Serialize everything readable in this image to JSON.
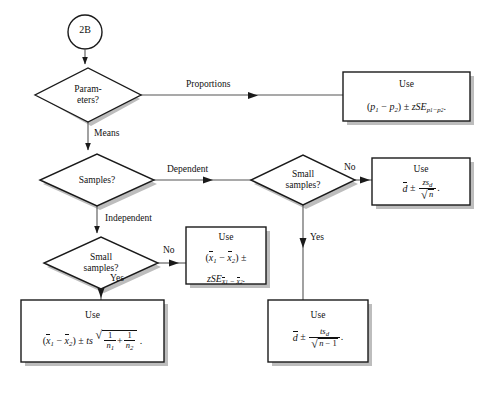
{
  "diagram": {
    "colors": {
      "stroke": "#1a1a1a",
      "shadow": "#b9b9b9",
      "connector": "#555555",
      "background": "#ffffff"
    },
    "nodes": {
      "start": {
        "label": "2B",
        "shape": "circle"
      },
      "parameters": {
        "label_line1": "Param-",
        "label_line2": "eters?",
        "shape": "diamond"
      },
      "samples": {
        "label_line1": "Samples?",
        "shape": "diamond"
      },
      "small_samples_dependent": {
        "label_line1": "Small",
        "label_line2": "samples?",
        "shape": "diamond"
      },
      "small_samples_independent": {
        "label_line1": "Small",
        "label_line2": "samples?",
        "shape": "diamond"
      }
    },
    "boxes": {
      "proportions": {
        "use": "Use",
        "formula_plain": "(p1 - p2) +/- zSE(p1-p2)."
      },
      "dependent_large": {
        "use": "Use",
        "formula_plain": "dbar +/- z*s_d / sqrt(n)."
      },
      "independent_large": {
        "use": "Use",
        "formula_plain": "(x1bar - x2bar) +/- zSE(x1bar - x2bar)."
      },
      "independent_small": {
        "use": "Use",
        "formula_plain": "(x1bar - x2bar) +/- ts * sqrt(1/n1 + 1/n2)."
      },
      "dependent_small": {
        "use": "Use",
        "formula_plain": "dbar +/- t*s_d / sqrt(n - 1)."
      }
    },
    "edge_labels": {
      "proportions": "Proportions",
      "means": "Means",
      "dependent": "Dependent",
      "independent": "Independent",
      "dep_no": "No",
      "dep_yes": "Yes",
      "ind_no": "No",
      "ind_yes": "Yes"
    }
  }
}
